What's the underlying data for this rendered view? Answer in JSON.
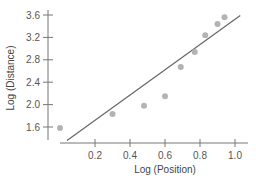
{
  "chart_data": {
    "type": "scatter",
    "title": "",
    "xlabel": "Log (Position)",
    "ylabel": "Log (Distance)",
    "xlim": [
      -0.05,
      1.08
    ],
    "ylim": [
      1.3,
      3.7
    ],
    "x_ticks": [
      0.2,
      0.4,
      0.6,
      0.8,
      1.0
    ],
    "x_tick_labels": [
      "0.2",
      "0.4",
      "0.6",
      "0.8",
      "1.0"
    ],
    "y_ticks": [
      1.6,
      2.0,
      2.4,
      2.8,
      3.2,
      3.6
    ],
    "y_tick_labels": [
      "1.6",
      "2.0",
      "2.4",
      "2.8",
      "3.2",
      "3.6"
    ],
    "grid": false,
    "legend": null,
    "series": [
      {
        "name": "observations",
        "kind": "scatter",
        "color": "#b3b3b3",
        "x": [
          0.0,
          0.3,
          0.48,
          0.6,
          0.69,
          0.77,
          0.83,
          0.9,
          0.94
        ],
        "y": [
          1.58,
          1.83,
          1.98,
          2.15,
          2.67,
          2.94,
          3.24,
          3.44,
          3.56
        ]
      },
      {
        "name": "regression line",
        "kind": "line",
        "color": "#666666",
        "x": [
          0.04,
          1.03
        ],
        "y": [
          1.36,
          3.59
        ]
      }
    ]
  }
}
